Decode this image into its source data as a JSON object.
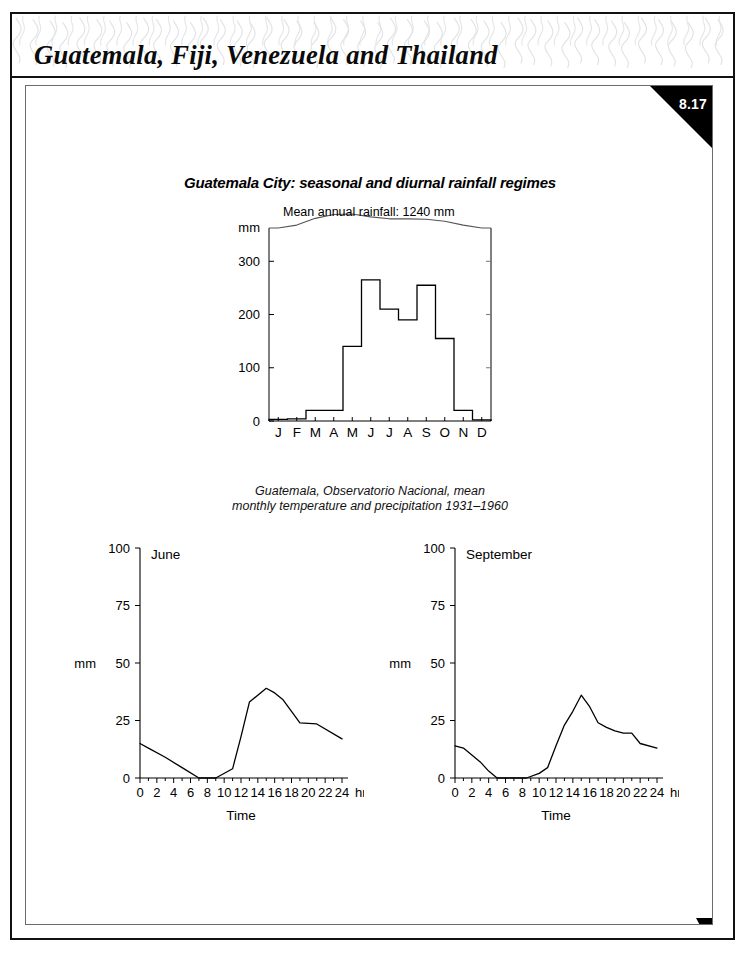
{
  "header": {
    "title": "Guatemala, Fiji, Venezuela and Thailand",
    "watermark_name": "squiggle-pattern"
  },
  "figure": {
    "number": "8.17",
    "badge_name": "figure-number-badge",
    "title": "Guatemala City: seasonal and diurnal rainfall regimes",
    "caption_line1": "Guatemala, Observatorio Nacional, mean",
    "caption_line2": "monthly temperature and precipitation 1931–1960",
    "next_arrow_name": "next-page-arrow"
  },
  "chart_data": [
    {
      "id": "seasonal",
      "type": "bar",
      "title": "Guatemala City: seasonal and diurnal rainfall regimes",
      "annotation": "Mean annual rainfall: 1240 mm",
      "xlabel": "",
      "ylabel": "mm",
      "ylim": [
        0,
        340
      ],
      "yticks": [
        0,
        100,
        200,
        300
      ],
      "ytick_labels": [
        "0",
        "100",
        "200",
        "300"
      ],
      "axis_break_label": "mm",
      "grid": false,
      "categories": [
        "J",
        "F",
        "M",
        "A",
        "M",
        "J",
        "J",
        "A",
        "S",
        "O",
        "N",
        "D"
      ],
      "category_names": [
        "January",
        "February",
        "March",
        "April",
        "May",
        "June",
        "July",
        "August",
        "September",
        "October",
        "November",
        "December"
      ],
      "values": [
        3,
        4,
        20,
        20,
        140,
        265,
        210,
        190,
        255,
        155,
        20,
        2
      ],
      "series": [
        {
          "name": "mean monthly precipitation",
          "units": "mm",
          "values": [
            3,
            4,
            20,
            20,
            140,
            265,
            210,
            190,
            255,
            155,
            20,
            2
          ]
        },
        {
          "name": "mean monthly temperature",
          "units": "°C",
          "note": "drawn as wavy curve above the axis break",
          "values": [
            17.0,
            17.6,
            19.0,
            19.8,
            19.9,
            19.3,
            18.9,
            18.9,
            18.8,
            18.4,
            17.6,
            17.0
          ]
        }
      ]
    },
    {
      "id": "june",
      "type": "line",
      "title": "June",
      "xlabel": "Time",
      "ylabel": "mm",
      "x_units": "hrs",
      "xlim": [
        0,
        24
      ],
      "ylim": [
        0,
        100
      ],
      "xticks": [
        0,
        2,
        4,
        6,
        8,
        10,
        12,
        14,
        16,
        18,
        20,
        22,
        24
      ],
      "xtick_labels": [
        "0",
        "2",
        "4",
        "6",
        "8",
        "10",
        "12",
        "14",
        "16",
        "18",
        "20",
        "22",
        "24"
      ],
      "yticks": [
        0,
        25,
        50,
        75,
        100
      ],
      "ytick_labels": [
        "0",
        "25",
        "50",
        "75",
        "100"
      ],
      "grid": false,
      "x": [
        0,
        1,
        3,
        5,
        7,
        9,
        11,
        12,
        13,
        15,
        16,
        17,
        18,
        19,
        21,
        24
      ],
      "y": [
        15,
        13,
        9,
        4.5,
        0,
        0,
        4,
        18,
        33,
        39,
        37,
        34,
        29,
        24,
        23.5,
        17
      ]
    },
    {
      "id": "september",
      "type": "line",
      "title": "September",
      "xlabel": "Time",
      "ylabel": "mm",
      "x_units": "hrs",
      "xlim": [
        0,
        24
      ],
      "ylim": [
        0,
        100
      ],
      "xticks": [
        0,
        2,
        4,
        6,
        8,
        10,
        12,
        14,
        16,
        18,
        20,
        22,
        24
      ],
      "xtick_labels": [
        "0",
        "2",
        "4",
        "6",
        "8",
        "10",
        "12",
        "14",
        "16",
        "18",
        "20",
        "22",
        "24"
      ],
      "yticks": [
        0,
        25,
        50,
        75,
        100
      ],
      "ytick_labels": [
        "0",
        "25",
        "50",
        "75",
        "100"
      ],
      "grid": false,
      "x": [
        0,
        1,
        2,
        3,
        4,
        5,
        8.5,
        10,
        11,
        12,
        13,
        14,
        15,
        16,
        17,
        18,
        19,
        20,
        21,
        22,
        24
      ],
      "y": [
        14,
        13,
        10,
        7,
        3,
        0,
        0,
        2,
        4.5,
        14,
        23,
        29,
        36,
        31,
        24,
        22,
        20.5,
        19.5,
        19.5,
        15,
        13
      ]
    }
  ],
  "colors": {
    "ink": "#000000",
    "frame": "#6b6b6b",
    "badge": "#000000",
    "badge_text": "#ffffff",
    "watermark": "#9aa0a6"
  }
}
